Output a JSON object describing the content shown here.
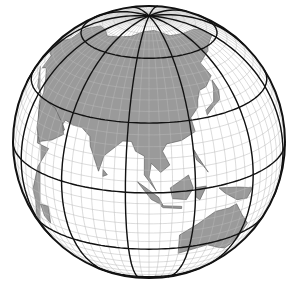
{
  "map": {
    "title": "Orthographic globe centered on Asia",
    "projection": {
      "type": "orthographic",
      "center_lon": 100,
      "center_lat": 22,
      "cx": 149,
      "cy": 142,
      "r": 136
    },
    "graticule": {
      "minor_step_deg": 5,
      "major_step_deg": 30
    },
    "colors": {
      "land": "#9a9a9a",
      "ocean": "#ffffff",
      "minor_grid": "#b8b8b8",
      "major_grid": "#111111",
      "outline": "#111111",
      "coast": "#555555"
    },
    "regions": [
      "Asia",
      "Europe",
      "Africa",
      "Australia",
      "Indonesia",
      "Japan",
      "Arctic"
    ]
  }
}
